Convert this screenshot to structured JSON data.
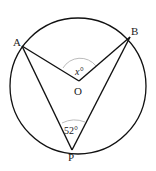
{
  "diagram": {
    "points": {
      "A": {
        "label": "A",
        "x": 22,
        "y": 46
      },
      "B": {
        "label": "B",
        "x": 130,
        "y": 37
      },
      "O": {
        "label": "O",
        "x": 79,
        "y": 81
      },
      "P": {
        "label": "P",
        "x": 72,
        "y": 150
      }
    },
    "circle": {
      "cx": 78,
      "cy": 86,
      "r": 68
    },
    "angles": {
      "central": {
        "vertex": "O",
        "label": "x°"
      },
      "inscribed": {
        "vertex": "P",
        "label": "52°"
      }
    },
    "segments": [
      "OA",
      "OB",
      "PA",
      "PB"
    ]
  }
}
